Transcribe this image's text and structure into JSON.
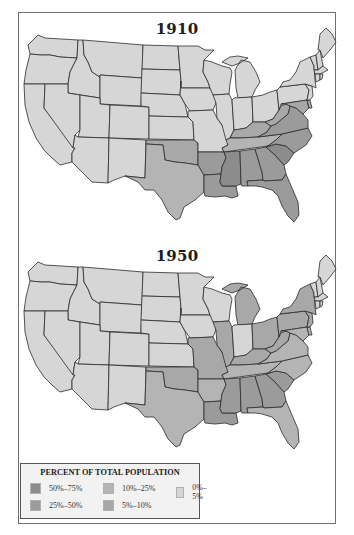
{
  "maps": [
    {
      "title": "1910"
    },
    {
      "title": "1950"
    }
  ],
  "legend": {
    "title": "PERCENT OF TOTAL POPULATION",
    "items": [
      {
        "label": "50%–75%",
        "color": "#8c8c8c"
      },
      {
        "label": "10%–25%",
        "color": "#b4b4b4"
      },
      {
        "label": "0%–5%",
        "color": "#d6d6d6"
      },
      {
        "label": "25%–50%",
        "color": "#9b9b9b"
      },
      {
        "label": "5%–10%",
        "color": "#a8a8a8"
      }
    ]
  },
  "categories": {
    "c0": "#d6d6d6",
    "c1": "#a8a8a8",
    "c2": "#b4b4b4",
    "c3": "#9b9b9b",
    "c4": "#8c8c8c"
  },
  "chart_data": {
    "type": "choropleth",
    "legend": [
      "50%–75%",
      "25%–50%",
      "10%–25%",
      "5%–10%",
      "0%–5%"
    ],
    "maps": [
      {
        "year": "1910",
        "high_50_75": [
          "MS",
          "SC"
        ],
        "mid_25_50": [
          "LA",
          "GA",
          "AL",
          "FL",
          "VA",
          "NC",
          "AR"
        ],
        "ten_25": [
          "TX",
          "TN"
        ],
        "five_10": [
          "OK",
          "KY",
          "WV",
          "MD",
          "DE"
        ],
        "zero_5": [
          "all other states"
        ]
      },
      {
        "year": "1950",
        "high_50_75": [],
        "mid_25_50": [
          "MS",
          "SC",
          "LA",
          "GA",
          "AL"
        ],
        "ten_25": [
          "NC",
          "VA",
          "AR",
          "TN",
          "TX",
          "FL",
          "MD",
          "DE"
        ],
        "five_10": [
          "MO",
          "IL",
          "MI",
          "OH",
          "NY",
          "PA",
          "NJ",
          "KY",
          "WV",
          "OK"
        ],
        "zero_5": [
          "all other states"
        ]
      }
    ]
  }
}
